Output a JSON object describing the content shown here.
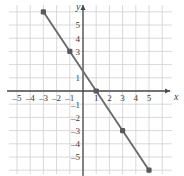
{
  "chart_data": {
    "type": "line",
    "title": "",
    "xlabel": "x",
    "ylabel": "y",
    "xlim": [
      -6,
      6
    ],
    "ylim": [
      -7,
      7
    ],
    "grid": true,
    "legend": "none",
    "x_ticks": [
      -5,
      -4,
      -3,
      -2,
      -1,
      1,
      2,
      3,
      4,
      5
    ],
    "x_tick_labels": [
      "–5",
      "–4",
      "–3",
      "–2",
      "–1",
      "1",
      "2",
      "3",
      "4",
      "5"
    ],
    "y_ticks": [
      5,
      4,
      3,
      1,
      -1,
      -2,
      -3,
      -4,
      -5
    ],
    "y_tick_labels": [
      "5",
      "4",
      "3",
      "1",
      "–1",
      "–2",
      "–3",
      "–4",
      "–5"
    ],
    "series": [
      {
        "name": "line",
        "slope": -1.5,
        "intercept": 1.5,
        "color": "#6b6b6b",
        "x": [
          -3,
          -1,
          1,
          3,
          5
        ],
        "values": [
          6,
          3,
          0,
          -3,
          -6
        ],
        "marked_points": [
          {
            "x": -3,
            "y": 6
          },
          {
            "x": -1,
            "y": 3
          },
          {
            "x": 1,
            "y": 0
          },
          {
            "x": 3,
            "y": -3
          },
          {
            "x": 5,
            "y": -6
          }
        ]
      }
    ],
    "colors": {
      "line": "#6b6b6b",
      "point": "#5a5a5a",
      "axis": "#4a4a4a",
      "grid": "#cfcfcf",
      "background": "#ffffff"
    }
  },
  "axis_labels": {
    "x": "x",
    "y": "y"
  }
}
